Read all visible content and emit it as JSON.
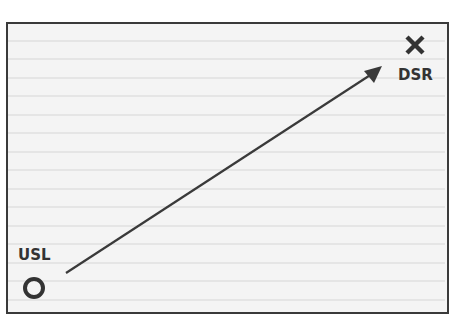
{
  "diagram": {
    "start": {
      "label": "USL",
      "marker": "circle-marker"
    },
    "end": {
      "label": "DSR",
      "marker": "x-marker"
    },
    "arrow": {
      "from": "USL",
      "to": "DSR"
    },
    "colors": {
      "stroke": "#3a3a3a",
      "background": "#f4f4f4",
      "ruled_line": "#d8d8d8"
    },
    "ruled_lines": 15
  }
}
